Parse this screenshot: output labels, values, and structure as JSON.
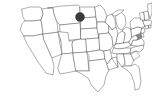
{
  "figure": {
    "kind": "map",
    "title": "United States outline map",
    "width_px": 152,
    "height_px": 101,
    "background_color": "#ffffff",
    "outline_color": "#4a4a4a",
    "highlight_fill_color": "#8a8a8a",
    "marker_color": "#3a3a3a"
  },
  "map_data": {
    "type": "choropleth-point",
    "region": "contiguous United States",
    "projection": "albers-like",
    "grid": false,
    "legend": false,
    "labels_visible": false,
    "highlighted_states": [
      {
        "name": "Maryland",
        "abbr": "MD",
        "fill": "#8a8a8a",
        "x": 128,
        "y": 38
      }
    ],
    "markers": [
      {
        "name": "Minnesota marker",
        "abbr": "MN",
        "shape": "circle",
        "fill": "#3a3a3a",
        "x": 80,
        "y": 17,
        "radius": 4.5
      }
    ],
    "states": [
      "Washington",
      "Oregon",
      "California",
      "Nevada",
      "Idaho",
      "Montana",
      "Wyoming",
      "Utah",
      "Arizona",
      "Colorado",
      "New Mexico",
      "North Dakota",
      "South Dakota",
      "Nebraska",
      "Kansas",
      "Oklahoma",
      "Texas",
      "Minnesota",
      "Iowa",
      "Missouri",
      "Arkansas",
      "Louisiana",
      "Wisconsin",
      "Illinois",
      "Mississippi",
      "Michigan",
      "Indiana",
      "Ohio",
      "Kentucky",
      "Tennessee",
      "Alabama",
      "Georgia",
      "Florida",
      "South Carolina",
      "North Carolina",
      "Virginia",
      "West Virginia",
      "Maryland",
      "Delaware",
      "Pennsylvania",
      "New Jersey",
      "New York",
      "Connecticut",
      "Rhode Island",
      "Massachusetts",
      "Vermont",
      "New Hampshire",
      "Maine"
    ]
  }
}
